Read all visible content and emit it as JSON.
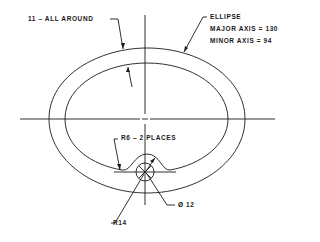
{
  "drawing": {
    "annotations": {
      "wall_thickness": "11 – ALL AROUND",
      "ellipse_title": "ELLIPSE",
      "major_axis": "MAJOR AXIS = 130",
      "minor_axis": "MINOR  AXIS =  94",
      "fillet_radius": "R6 –   2 PLACES",
      "hole_diameter": "Ø 12",
      "boss_radius": "R14"
    },
    "colors": {
      "line": "#1a1a1a",
      "background": "#ffffff"
    }
  }
}
